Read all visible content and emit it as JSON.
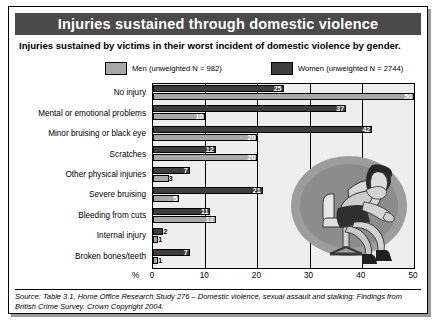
{
  "figure": {
    "title": "Injuries sustained through domestic violence",
    "subtitle": "Injuries sustained by victims in their worst incident of domestic violence by gender.",
    "source": "Source: Table 3.1, Home Office Research Study 276 – Domestic violence, sexual assault and stalking: Findings from British Crime Survey. Crown Copyright 2004.",
    "illustration_name": "seated-woman-illustration"
  },
  "colors": {
    "banner_bg": "#4a4a4a",
    "banner_text": "#ffffff",
    "men_bar": "#a8a8a8",
    "women_bar": "#3d3d3d",
    "plot_bg": "#eeeeee",
    "axis": "#000000"
  },
  "legend": {
    "men": "Men (unweighted N = 982)",
    "women": "Women (unweighted N = 2744)"
  },
  "chart_data": {
    "type": "bar",
    "orientation": "horizontal",
    "title": "Injuries sustained through domestic violence",
    "subtitle": "Injuries sustained by victims in their worst incident of domestic violence by gender.",
    "xlabel": "%",
    "ylabel": "",
    "xlim": [
      0,
      50
    ],
    "xticks": [
      "0",
      "10",
      "20",
      "30",
      "40",
      "50"
    ],
    "grid": true,
    "legend_position": "top",
    "categories": [
      "No injury",
      "Mental or emotional problems",
      "Minor bruising or black eye",
      "Scratches",
      "Other physical injuries",
      "Severe bruising",
      "Bleeding from cuts",
      "Internal injury",
      "Broken bones/teeth"
    ],
    "series": [
      {
        "name": "Women (unweighted N = 2744)",
        "values": [
          25,
          37,
          42,
          12,
          7,
          21,
          11,
          2,
          7
        ]
      },
      {
        "name": "Men (unweighted N = 982)",
        "values": [
          50,
          10,
          20,
          20,
          3,
          5,
          12,
          1,
          1
        ]
      }
    ]
  }
}
